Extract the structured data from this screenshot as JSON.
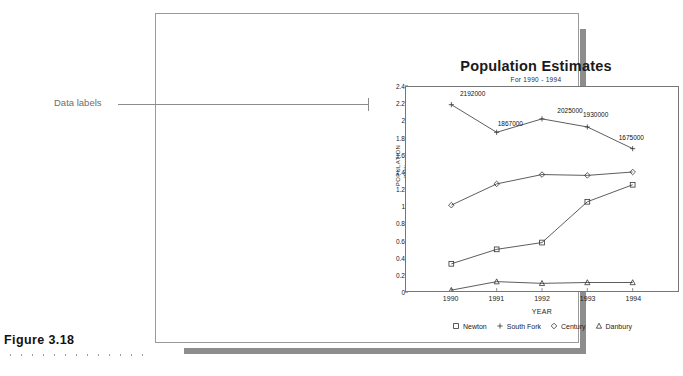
{
  "figure": {
    "caption": "Figure 3.18"
  },
  "annotation": {
    "label": "Data labels"
  },
  "chart_data": {
    "type": "line",
    "title": "Population Estimates",
    "subtitle": "For 1990 - 1994",
    "xlabel": "YEAR",
    "ylabel_line1": "POPULATION",
    "ylabel_line2": "(Millions)",
    "categories": [
      "1990",
      "1991",
      "1992",
      "1993",
      "1994"
    ],
    "ylim": [
      0,
      2.4
    ],
    "yticks": [
      "0",
      "0.2",
      "0.4",
      "0.6",
      "0.8",
      "1",
      "1.2",
      "1.4",
      "1.6",
      "1.8",
      "2",
      "2.2",
      "2.4"
    ],
    "grid": false,
    "legend_position": "bottom",
    "series": [
      {
        "name": "Newton",
        "marker": "square",
        "values": [
          0.32,
          0.49,
          0.57,
          1.05,
          1.25
        ]
      },
      {
        "name": "South Fork",
        "marker": "plus",
        "values": [
          2.192,
          1.867,
          2.025,
          1.93,
          1.675
        ],
        "data_labels": [
          "2192000",
          "1867000",
          "2025000",
          "1930000",
          "1675000"
        ]
      },
      {
        "name": "Century",
        "marker": "diamond",
        "values": [
          1.01,
          1.26,
          1.37,
          1.36,
          1.4
        ]
      },
      {
        "name": "Danbury",
        "marker": "triangle",
        "values": [
          0.01,
          0.11,
          0.09,
          0.1,
          0.1
        ]
      }
    ],
    "colors": {
      "line": "#333333",
      "axis": "#767676",
      "text": "#222222"
    }
  }
}
